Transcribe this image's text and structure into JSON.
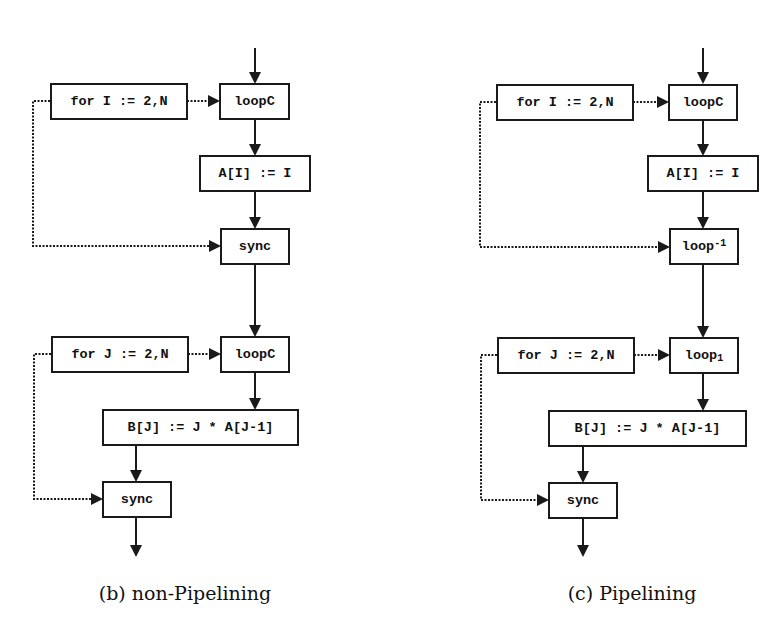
{
  "figure": {
    "panels": [
      {
        "id": "b",
        "caption": "(b) non-Pipelining",
        "nodes": {
          "for_i": "for I := 2,N",
          "loop_top": "loopC",
          "assign_a": "A[I] := I",
          "mid_base": "sync",
          "mid_script": "",
          "for_j": "for J := 2,N",
          "loop_bottom_base": "loopC",
          "loop_bottom_script": "",
          "assign_b": "B[J] := J * A[J-1]",
          "sync_end": "sync"
        }
      },
      {
        "id": "c",
        "caption": "(c) Pipelining",
        "nodes": {
          "for_i": "for I := 2,N",
          "loop_top": "loopC",
          "assign_a": "A[I] := I",
          "mid_base": "loop",
          "mid_script": "-1",
          "for_j": "for J := 2,N",
          "loop_bottom_base": "loop",
          "loop_bottom_script": "1",
          "assign_b": "B[J] := J * A[J-1]",
          "sync_end": "sync"
        }
      }
    ],
    "edge_styles": {
      "control_flow": "solid",
      "loop_relation": "dotted"
    },
    "colors": {
      "line": "#1a1a1a",
      "background": "#ffffff"
    }
  }
}
